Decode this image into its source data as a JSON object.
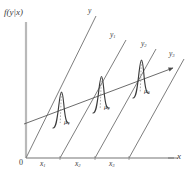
{
  "figure": {
    "type": "statistical-diagram",
    "background_color": "#ffffff",
    "ink_color": "#4a4a4a"
  },
  "axes": {
    "y_axis_label": "f(y|x)",
    "x_axis_label": "x",
    "origin_label": "0",
    "y_axis": {
      "x": 26,
      "y_top": 22,
      "y_bottom": 158
    },
    "x_axis": {
      "y": 158,
      "x_left": 26,
      "x_right": 176
    }
  },
  "x_ticks": [
    {
      "label": "x",
      "sub": "1",
      "x": 45
    },
    {
      "label": "x",
      "sub": "2",
      "x": 79
    },
    {
      "label": "x",
      "sub": "3",
      "x": 114
    }
  ],
  "parallel_lines": [
    {
      "label": "y",
      "sub": "",
      "base_x": 26,
      "top_x": 96,
      "label_x": 88,
      "label_y": 7
    },
    {
      "label": "y",
      "sub": "1",
      "base_x": 60,
      "top_x": 126,
      "label_x": 110,
      "label_y": 31
    },
    {
      "label": "y",
      "sub": "2",
      "base_x": 95,
      "top_x": 156,
      "label_x": 141,
      "label_y": 40
    },
    {
      "label": "y",
      "sub": "3",
      "base_x": 129,
      "top_x": 184,
      "label_x": 169,
      "label_y": 50
    }
  ],
  "regression_line": {
    "name": "regression-line",
    "x_start": 24,
    "y_start": 123,
    "x_end": 176,
    "y_end": 66,
    "has_arrowhead": true
  },
  "distributions": [
    {
      "name": "conditional-density-1",
      "mean_label": "μ",
      "mean_sub": "1",
      "center_x": 61,
      "base_y": 122,
      "height": 31,
      "label_x": 64,
      "label_y": 118
    },
    {
      "name": "conditional-density-2",
      "mean_label": "μ",
      "mean_sub": "2",
      "center_x": 101,
      "base_y": 107,
      "height": 33,
      "label_x": 104,
      "label_y": 103
    },
    {
      "name": "conditional-density-3",
      "mean_label": "μ",
      "mean_sub": "3",
      "center_x": 141,
      "base_y": 92,
      "height": 35,
      "label_x": 144,
      "label_y": 87
    }
  ]
}
